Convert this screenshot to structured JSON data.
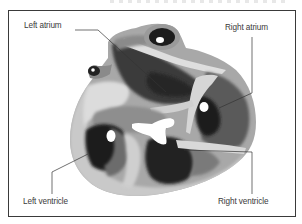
{
  "figure": {
    "type": "anatomical-diagram",
    "frame_color": "#3a3a3a",
    "label_color": "#3a3a3a"
  },
  "labels": {
    "left_atrium": "Left atrium",
    "right_atrium": "Right atrium",
    "left_ventricle": "Left ventricle",
    "right_ventricle": "Right ventricle"
  },
  "shades": {
    "light": "#d4d4d4",
    "mid": "#9a9a9a",
    "dark": "#3e3e3e",
    "darkest": "#1c1c1c",
    "cavity": "#ffffff"
  }
}
